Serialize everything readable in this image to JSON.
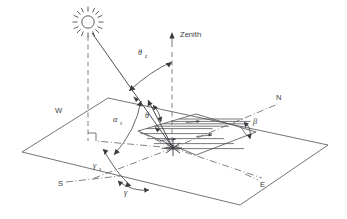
{
  "figure": {
    "background_color": "#ffffff",
    "line_color": "#55565a"
  },
  "compass": {
    "north": "N",
    "south": "S",
    "east": "E",
    "west": "W"
  },
  "zenith": {
    "label": "Zenith",
    "arrow": "up-arrow"
  },
  "angles": {
    "zenith_angle": {
      "symbol": "θ",
      "subscript": "z",
      "name": "solar-zenith-angle"
    },
    "incidence_angle": {
      "symbol": "θ",
      "subscript": "",
      "name": "angle-of-incidence"
    },
    "solar_altitude": {
      "symbol": "α",
      "subscript": "s",
      "name": "solar-altitude-angle"
    },
    "solar_azimuth": {
      "symbol": "γ",
      "subscript": "s",
      "name": "solar-azimuth-angle"
    },
    "surface_azimuth": {
      "symbol": "γ",
      "subscript": "",
      "name": "surface-azimuth-angle"
    },
    "slope": {
      "symbol": "β",
      "subscript": "",
      "name": "surface-tilt-angle"
    }
  },
  "elements": {
    "sun": "sun-icon",
    "ground_plane": "horizontal-reference-plane",
    "tilted_surface": "tilted-collector-surface",
    "sun_ray": "incident-beam-ray",
    "normal": "surface-normal",
    "origin": "origin-point"
  }
}
